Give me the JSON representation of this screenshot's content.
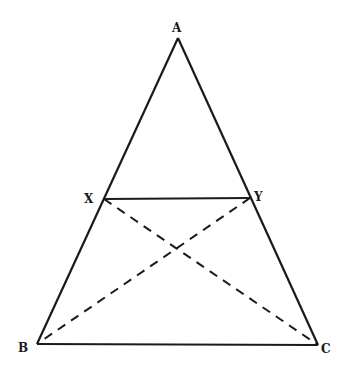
{
  "diagram": {
    "type": "triangle with parallel segment and diagonals",
    "stroke_color": "#1a1a1a",
    "background": "#ffffff",
    "vertices": [
      {
        "label": "A",
        "x": 178,
        "y": 38
      },
      {
        "label": "B",
        "x": 37,
        "y": 344
      },
      {
        "label": "C",
        "x": 318,
        "y": 345
      },
      {
        "label": "X",
        "x": 104,
        "y": 199
      },
      {
        "label": "Y",
        "x": 250,
        "y": 198
      }
    ],
    "solid_segments": [
      "AB",
      "AC",
      "BC",
      "XY"
    ],
    "dashed_segments": [
      "XC",
      "YB"
    ],
    "labels": {
      "A": "A",
      "B": "B",
      "C": "C",
      "X": "X",
      "Y": "Y"
    }
  }
}
